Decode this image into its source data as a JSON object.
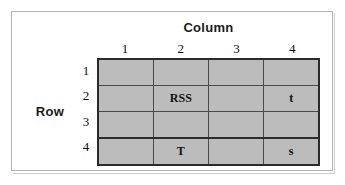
{
  "figure": {
    "column_axis_label": "Column",
    "row_axis_label": "Row",
    "column_headers": [
      "1",
      "2",
      "3",
      "4"
    ],
    "row_headers": [
      "1",
      "2",
      "3",
      "4"
    ],
    "cells": [
      [
        "",
        "",
        "",
        ""
      ],
      [
        "",
        "RSS",
        "",
        "t"
      ],
      [
        "",
        "",
        "",
        ""
      ],
      [
        "",
        "T",
        "",
        "s"
      ]
    ],
    "colors": {
      "cell_fill": "#bcbcbc",
      "grid_line": "#4a4a4a",
      "grid_outer_line": "#2b2b2b",
      "frame_border": "#b3b3b3",
      "background": "#ffffff",
      "text": "#111111"
    }
  }
}
